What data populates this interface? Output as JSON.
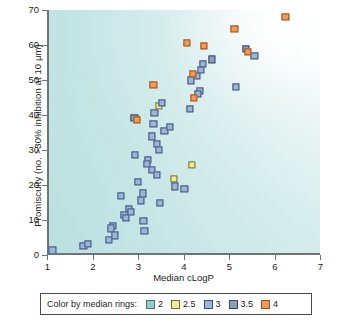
{
  "chart_data": {
    "type": "scatter",
    "title": "",
    "xlabel": "Median cLogP",
    "ylabel": "Promiscuity (no. >30% inhibition at 10 μm)",
    "xlim": [
      1,
      7
    ],
    "ylim": [
      0,
      70
    ],
    "xticks": [
      1,
      2,
      3,
      4,
      5,
      6,
      7
    ],
    "yticks": [
      0,
      10,
      20,
      30,
      40,
      50,
      60,
      70
    ],
    "grid": false,
    "legend_position": "below-axes",
    "legend_title": "Color by median rings:",
    "series": [
      {
        "name": "2",
        "color": "#8fcfcb",
        "edge": "#4f6f77",
        "points": []
      },
      {
        "name": "2.5",
        "color": "#f2ea8e",
        "edge": "#6c6a3a",
        "points": [
          {
            "x": 3.46,
            "y": 42.5
          },
          {
            "x": 4.18,
            "y": 25.8
          },
          {
            "x": 3.79,
            "y": 21.8
          }
        ]
      },
      {
        "name": "3",
        "color": "#9db6d8",
        "edge": "#3c4f79",
        "points": [
          {
            "x": 1.12,
            "y": 1.3
          },
          {
            "x": 1.8,
            "y": 2.6
          },
          {
            "x": 1.9,
            "y": 3.2
          },
          {
            "x": 2.36,
            "y": 4.2
          },
          {
            "x": 2.44,
            "y": 8.3
          },
          {
            "x": 2.4,
            "y": 7.6
          },
          {
            "x": 2.5,
            "y": 5.6
          },
          {
            "x": 2.62,
            "y": 17.0
          },
          {
            "x": 2.7,
            "y": 11.5
          },
          {
            "x": 2.74,
            "y": 10.6
          },
          {
            "x": 2.8,
            "y": 13.2
          },
          {
            "x": 2.84,
            "y": 12.4
          },
          {
            "x": 2.94,
            "y": 28.6
          },
          {
            "x": 3.0,
            "y": 20.9
          },
          {
            "x": 3.06,
            "y": 15.6
          },
          {
            "x": 3.1,
            "y": 17.6
          },
          {
            "x": 3.12,
            "y": 9.7
          },
          {
            "x": 3.14,
            "y": 6.9
          },
          {
            "x": 3.22,
            "y": 27.2
          },
          {
            "x": 3.2,
            "y": 26.0
          },
          {
            "x": 3.3,
            "y": 24.2
          },
          {
            "x": 3.36,
            "y": 40.6
          },
          {
            "x": 3.34,
            "y": 37.5
          },
          {
            "x": 3.3,
            "y": 33.9
          },
          {
            "x": 3.42,
            "y": 31.8
          },
          {
            "x": 3.46,
            "y": 30.1
          },
          {
            "x": 3.42,
            "y": 23.0
          },
          {
            "x": 3.48,
            "y": 14.8
          },
          {
            "x": 3.58,
            "y": 35.5
          },
          {
            "x": 3.7,
            "y": 36.5
          },
          {
            "x": 3.52,
            "y": 43.5
          },
          {
            "x": 3.82,
            "y": 19.6
          },
          {
            "x": 4.02,
            "y": 18.9
          },
          {
            "x": 4.16,
            "y": 49.9
          },
          {
            "x": 4.14,
            "y": 41.8
          },
          {
            "x": 4.3,
            "y": 51.2
          },
          {
            "x": 4.36,
            "y": 46.8
          },
          {
            "x": 4.32,
            "y": 46.1
          },
          {
            "x": 4.38,
            "y": 53.0
          },
          {
            "x": 4.42,
            "y": 54.5
          },
          {
            "x": 5.16,
            "y": 48.0
          },
          {
            "x": 5.56,
            "y": 57.0
          }
        ]
      },
      {
        "name": "3.5",
        "color": "#8a9fba",
        "edge": "#38465e",
        "points": [
          {
            "x": 2.92,
            "y": 39.2
          },
          {
            "x": 4.62,
            "y": 55.9
          },
          {
            "x": 5.38,
            "y": 59.0
          }
        ]
      },
      {
        "name": "4",
        "color": "#ef9a5c",
        "edge": "#9a4f1e",
        "points": [
          {
            "x": 2.98,
            "y": 38.6
          },
          {
            "x": 3.34,
            "y": 48.7
          },
          {
            "x": 4.08,
            "y": 60.5
          },
          {
            "x": 4.2,
            "y": 51.7
          },
          {
            "x": 4.22,
            "y": 44.8
          },
          {
            "x": 4.44,
            "y": 59.8
          },
          {
            "x": 5.12,
            "y": 64.6
          },
          {
            "x": 5.42,
            "y": 58.0
          },
          {
            "x": 6.24,
            "y": 68.0
          }
        ]
      }
    ]
  },
  "legend": {
    "title": "Color by median rings:",
    "items": [
      {
        "label": "2",
        "fill": "#8fcfcb",
        "edge": "#4f6f77"
      },
      {
        "label": "2.5",
        "fill": "#f2ea8e",
        "edge": "#6c6a3a"
      },
      {
        "label": "3",
        "fill": "#9db6d8",
        "edge": "#3c4f79"
      },
      {
        "label": "3.5",
        "fill": "#8a9fba",
        "edge": "#38465e"
      },
      {
        "label": "4",
        "fill": "#ef9a5c",
        "edge": "#9a4f1e"
      }
    ]
  }
}
